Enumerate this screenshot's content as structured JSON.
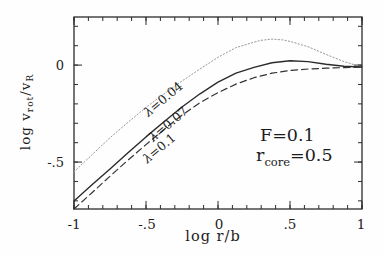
{
  "figure": {
    "background": "#fefefe",
    "frame_color": "#2b2b2b",
    "x_axis": {
      "label": "log r/b",
      "ticks": [
        {
          "value": -1.0,
          "label": "-1"
        },
        {
          "value": -0.5,
          "label": "-.5"
        },
        {
          "value": 0.0,
          "label": "0"
        },
        {
          "value": 0.5,
          "label": ".5"
        },
        {
          "value": 1.0,
          "label": "1"
        }
      ]
    },
    "y_axis": {
      "label_parts": {
        "p1": "log v",
        "s1": "rot",
        "p2": "/v",
        "s2": "R"
      },
      "ticks": [
        {
          "value": 0.0,
          "label": "0"
        },
        {
          "value": -0.5,
          "label": "-.5"
        }
      ]
    },
    "curve_labels": [
      {
        "lambda": "λ",
        "text": "=0.04"
      },
      {
        "lambda": "λ",
        "text": "=0.07"
      },
      {
        "lambda": "λ",
        "text": "=0.1"
      }
    ],
    "annotations": {
      "line1": "F=0.1",
      "line2_base": "r",
      "line2_sub": "core",
      "line2_rest": "=0.5"
    }
  },
  "chart_data": {
    "type": "line",
    "title": "",
    "xlabel": "log r/b",
    "ylabel": "log v_rot/v_R",
    "xlim": [
      -1.0,
      1.0
    ],
    "ylim": [
      -0.742,
      0.248
    ],
    "x_minor_step": 0.1,
    "y_minor_step": 0.1,
    "x_major": [
      -1.0,
      -0.5,
      0.0,
      0.5,
      1.0
    ],
    "y_major": [
      0.0,
      -0.5
    ],
    "grid": false,
    "legend": "inline curve labels",
    "series": [
      {
        "name": "λ=0.04",
        "style": "dotted",
        "color": "#999999",
        "width": 1.0,
        "points": [
          [
            -1,
            -0.55
          ],
          [
            -0.875,
            -0.462
          ],
          [
            -0.75,
            -0.375
          ],
          [
            -0.625,
            -0.295
          ],
          [
            -0.5,
            -0.218
          ],
          [
            -0.375,
            -0.148
          ],
          [
            -0.25,
            -0.082
          ],
          [
            -0.125,
            -0.02
          ],
          [
            0,
            0.04
          ],
          [
            0.125,
            0.09
          ],
          [
            0.25,
            0.118
          ],
          [
            0.3,
            0.128
          ],
          [
            0.375,
            0.134
          ],
          [
            0.45,
            0.13
          ],
          [
            0.5,
            0.122
          ],
          [
            0.625,
            0.095
          ],
          [
            0.75,
            0.055
          ],
          [
            0.875,
            0.018
          ],
          [
            1,
            -0.01
          ]
        ]
      },
      {
        "name": "λ=0.07",
        "style": "solid",
        "color": "#2b2b2b",
        "width": 1.4,
        "points": [
          [
            -1,
            -0.7
          ],
          [
            -0.875,
            -0.617
          ],
          [
            -0.75,
            -0.535
          ],
          [
            -0.625,
            -0.452
          ],
          [
            -0.5,
            -0.37
          ],
          [
            -0.375,
            -0.292
          ],
          [
            -0.25,
            -0.216
          ],
          [
            -0.125,
            -0.148
          ],
          [
            0,
            -0.088
          ],
          [
            0.125,
            -0.042
          ],
          [
            0.25,
            -0.012
          ],
          [
            0.375,
            0.012
          ],
          [
            0.5,
            0.022
          ],
          [
            0.625,
            0.018
          ],
          [
            0.75,
            0.004
          ],
          [
            0.875,
            -0.006
          ],
          [
            1,
            -0.01
          ]
        ]
      },
      {
        "name": "λ=0.1",
        "style": "dashed",
        "color": "#333333",
        "width": 1.2,
        "points": [
          [
            -1,
            -0.742
          ],
          [
            -0.875,
            -0.658
          ],
          [
            -0.75,
            -0.573
          ],
          [
            -0.625,
            -0.49
          ],
          [
            -0.5,
            -0.41
          ],
          [
            -0.375,
            -0.332
          ],
          [
            -0.25,
            -0.258
          ],
          [
            -0.125,
            -0.194
          ],
          [
            0,
            -0.142
          ],
          [
            0.125,
            -0.098
          ],
          [
            0.25,
            -0.065
          ],
          [
            0.375,
            -0.042
          ],
          [
            0.5,
            -0.028
          ],
          [
            0.625,
            -0.02
          ],
          [
            0.75,
            -0.016
          ],
          [
            0.875,
            -0.013
          ],
          [
            1,
            -0.011
          ]
        ]
      }
    ],
    "annotations_text": [
      "F=0.1",
      "r_core=0.5"
    ]
  }
}
